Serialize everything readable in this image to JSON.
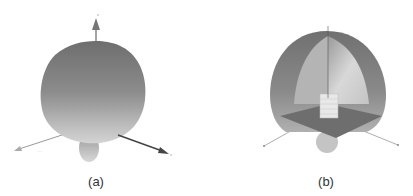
{
  "figure": {
    "panels": [
      {
        "id": "a",
        "label": "(a)",
        "description": "3D radiation pattern with coordinate axes"
      },
      {
        "id": "b",
        "label": "(b)",
        "description": "Cut-away 3D radiation pattern with antenna structure on ground plane"
      }
    ],
    "axis_labels": {
      "z": "z",
      "x": "x",
      "y": "y"
    },
    "colors": {
      "surface_dark": "#7a7a7a",
      "surface_light": "#c8c8c8",
      "axis": "#555555",
      "arrow": "#444444"
    }
  }
}
